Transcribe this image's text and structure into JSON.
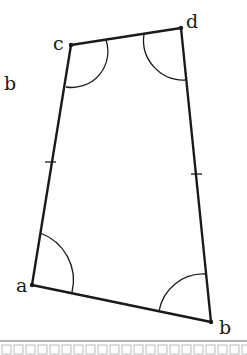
{
  "figure": {
    "type": "quadrilateral",
    "vertices": [
      {
        "name": "a",
        "label": "a",
        "x": 32,
        "y": 285
      },
      {
        "name": "b",
        "label": "b",
        "x": 211,
        "y": 322
      },
      {
        "name": "c",
        "label": "c",
        "x": 71,
        "y": 45
      },
      {
        "name": "d",
        "label": "d",
        "x": 181,
        "y": 28
      }
    ],
    "side_label": {
      "label": "b",
      "x": 6,
      "y": 88
    },
    "tick_marks": [
      "side-ca",
      "side-db"
    ],
    "angle_arcs": [
      "a",
      "b",
      "c",
      "d"
    ],
    "stroke_color": "#1a1a1a",
    "border_color": "#999999"
  }
}
